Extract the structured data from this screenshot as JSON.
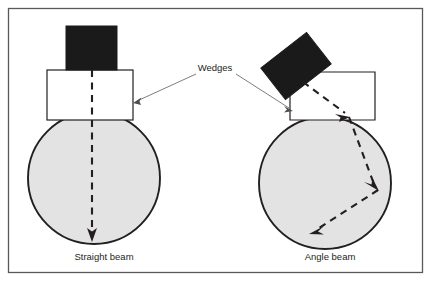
{
  "figure": {
    "border_color": "#58595b",
    "background_color": "#ffffff"
  },
  "colors": {
    "transducer_fill": "#1a1a1a",
    "wedge_fill": "#ffffff",
    "wedge_stroke": "#231f20",
    "specimen_fill": "#e3e3e3",
    "specimen_stroke": "#231f20",
    "beam_color": "#231f20",
    "leader_color": "#6d6e71",
    "text_color": "#231f20"
  },
  "callout": {
    "label": "Wedges",
    "x": 215,
    "y": 71
  },
  "panels": [
    {
      "id": "straight-beam",
      "caption": "Straight beam",
      "caption_x": 104,
      "caption_y": 260,
      "specimen": {
        "cx": 94,
        "cy": 178,
        "r": 66
      },
      "wedge": {
        "x": 47,
        "y": 70,
        "width": 86,
        "height": 50
      },
      "transducer": {
        "x": 66,
        "y": 26,
        "width": 51,
        "height": 44,
        "rotation": 0
      },
      "beam": {
        "type": "straight",
        "points": [
          {
            "x": 92,
            "y": 70
          },
          {
            "x": 92,
            "y": 240
          }
        ],
        "arrow_at": [
          {
            "x": 92,
            "y": 240
          }
        ]
      },
      "leader": {
        "x1": 196,
        "y1": 74,
        "x2": 134,
        "y2": 103
      }
    },
    {
      "id": "angle-beam",
      "caption": "Angle beam",
      "caption_x": 330,
      "caption_y": 260,
      "specimen": {
        "cx": 325,
        "cy": 183,
        "r": 66
      },
      "wedge": {
        "points": "290,120 290,88 320,72 375,72 375,120",
        "x": 290,
        "y": 72,
        "width": 85,
        "height": 48
      },
      "transducer": {
        "cx": 296,
        "cy": 66,
        "width": 58,
        "height": 40,
        "rotation": -38
      },
      "beam": {
        "type": "zigzag",
        "points": [
          {
            "x": 303,
            "y": 82
          },
          {
            "x": 349,
            "y": 117
          },
          {
            "x": 378,
            "y": 190
          },
          {
            "x": 310,
            "y": 233
          }
        ],
        "arrow_at": [
          {
            "x": 349,
            "y": 117
          },
          {
            "x": 378,
            "y": 190
          },
          {
            "x": 310,
            "y": 233
          }
        ]
      },
      "leader": {
        "x1": 236,
        "y1": 74,
        "x2": 293,
        "y2": 110
      }
    }
  ]
}
